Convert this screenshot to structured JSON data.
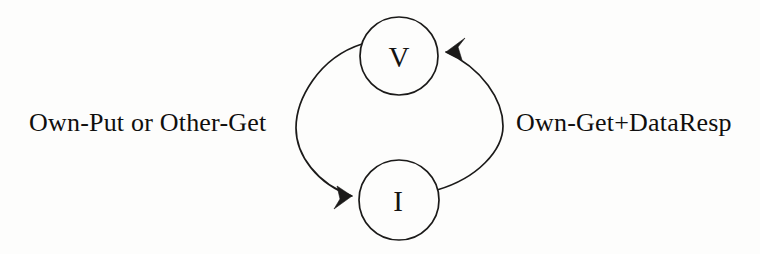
{
  "diagram": {
    "kind": "state-transition-diagram",
    "title": "",
    "background_color": "#fdfdfc",
    "stroke_color": "#1b1a19",
    "text_color": "#100f0e",
    "states": [
      {
        "id": "valid",
        "label": "V",
        "cx": 399,
        "cy": 56,
        "r": 39
      },
      {
        "id": "invalid",
        "label": "I",
        "cx": 399,
        "cy": 200,
        "r": 40
      }
    ],
    "transitions": [
      {
        "id": "valid-to-invalid",
        "from": "valid",
        "to": "invalid",
        "side": "left",
        "label": "Own-Put or Other-Get",
        "arrowhead": "at-invalid"
      },
      {
        "id": "invalid-to-valid",
        "from": "invalid",
        "to": "valid",
        "side": "right",
        "label": "Own-Get+DataResp",
        "arrowhead": "at-valid"
      }
    ]
  }
}
